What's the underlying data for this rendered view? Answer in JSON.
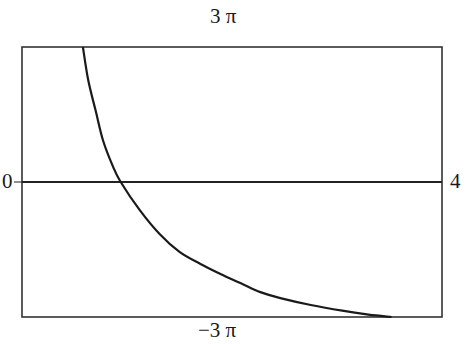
{
  "chart_data": {
    "type": "line",
    "title": "",
    "xlabel": "",
    "ylabel": "",
    "xlim": [
      0,
      4
    ],
    "ylim": [
      -9.42,
      9.42
    ],
    "frame_labels": {
      "top": "3 π",
      "bottom": "−3 π",
      "left": "0",
      "right": "4"
    },
    "grid": false,
    "legend": null,
    "reference_line": {
      "y": 0,
      "label": "zero axis"
    },
    "series": [
      {
        "name": "curve",
        "x": [
          0.58,
          0.63,
          0.7,
          0.77,
          0.86,
          0.94,
          1.12,
          1.31,
          1.5,
          1.7,
          1.89,
          2.08,
          2.27,
          2.46,
          2.75,
          3.05,
          3.3,
          3.52
        ],
        "y": [
          9.42,
          7.12,
          5.02,
          2.93,
          1.19,
          0.0,
          -1.95,
          -3.63,
          -4.88,
          -5.72,
          -6.42,
          -7.05,
          -7.68,
          -8.1,
          -8.58,
          -8.98,
          -9.25,
          -9.42
        ]
      }
    ]
  },
  "labels": {
    "top": "3 π",
    "bottom": "−3 π",
    "left": "0",
    "right": "4"
  },
  "style": {
    "line_color": "#1a1a1a",
    "frame_color": "#333333",
    "background": "#ffffff"
  }
}
